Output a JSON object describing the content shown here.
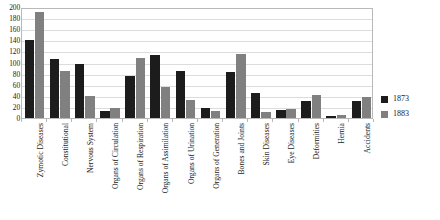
{
  "chart_data": {
    "type": "bar",
    "title": "",
    "xlabel": "",
    "ylabel": "",
    "ylim": [
      0,
      200
    ],
    "ytick_step": 20,
    "grid": true,
    "legend_position": "right",
    "categories": [
      "Zymotic Diseases",
      "Constitutional",
      "Nervous System",
      "Organs of Circulation",
      "Organs of Respiration",
      "Organs of Assimilation",
      "Organs of Urination",
      "Organs of Generation",
      "Bones and Joints",
      "Skin Diseases",
      "Eye Diseases",
      "Deformities",
      "Hernia",
      "Accidents"
    ],
    "yticks": [
      0,
      20,
      40,
      60,
      80,
      100,
      120,
      140,
      160,
      180,
      200
    ],
    "series": [
      {
        "name": "1873",
        "color": "#1c1c1c",
        "values": [
          141,
          106,
          97,
          12,
          76,
          114,
          84,
          18,
          83,
          45,
          15,
          30,
          3,
          30
        ]
      },
      {
        "name": "1883",
        "color": "#808080",
        "values": [
          191,
          85,
          40,
          18,
          109,
          55,
          33,
          13,
          116,
          11,
          16,
          42,
          5,
          37
        ]
      }
    ]
  },
  "legend": {
    "entries": [
      {
        "label": "1873"
      },
      {
        "label": "1883"
      }
    ]
  }
}
